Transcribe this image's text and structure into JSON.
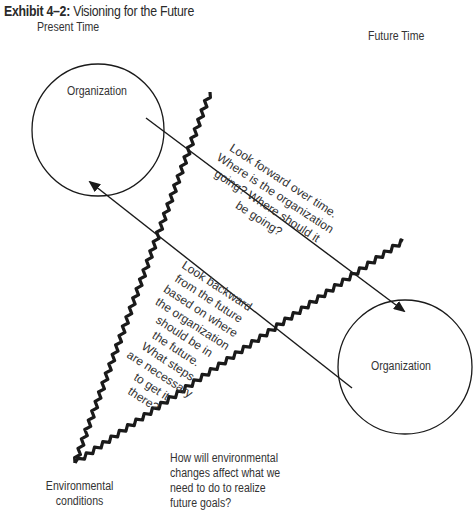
{
  "title": {
    "exhibit": "Exhibit 4–2:",
    "text": "Visioning for the Future"
  },
  "headers": {
    "present": "Present Time",
    "future": "Future Time"
  },
  "nodes": {
    "present_org": "Organization",
    "future_org": "Organization"
  },
  "forward_text": [
    "Look forward over time.",
    "Where is the organization",
    "going? Where should it",
    "be going?"
  ],
  "backward_text": [
    "Look backward",
    "from the future",
    "based on where",
    "the organization",
    "should be in",
    "the future.",
    "What steps",
    "are necessary",
    "to get it",
    "there?"
  ],
  "environment_label": [
    "Environmental",
    "conditions"
  ],
  "environment_question": [
    "How will environmental",
    "changes affect what we",
    "need to do to realize",
    "future goals?"
  ],
  "colors": {
    "stroke": "#1a1a1a",
    "text": "#333333",
    "background": "#ffffff"
  }
}
